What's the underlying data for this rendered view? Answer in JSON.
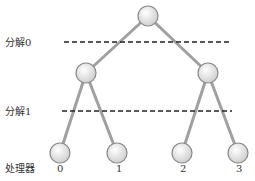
{
  "colors": {
    "edge": "#a0a0a0",
    "node_stroke": "#8a8a8a",
    "node_fill_light": "#ffffff",
    "node_fill_dark": "#d4d4d4",
    "dash": "#222222",
    "text": "#333333"
  },
  "labels": {
    "split0": "分解0",
    "split1": "分解1",
    "processor": "处理器"
  },
  "processors": [
    "0",
    "1",
    "2",
    "3"
  ],
  "tree": {
    "root": {
      "x": 148,
      "y": 16
    },
    "level1": [
      {
        "x": 86,
        "y": 73
      },
      {
        "x": 208,
        "y": 73
      }
    ],
    "leaves": [
      {
        "x": 60,
        "y": 153
      },
      {
        "x": 117,
        "y": 153
      },
      {
        "x": 182,
        "y": 153
      },
      {
        "x": 238,
        "y": 153
      }
    ],
    "node_radius": 10
  }
}
